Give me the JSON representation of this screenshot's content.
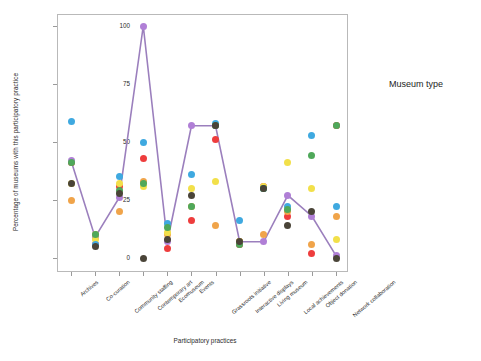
{
  "chart_data": {
    "type": "scatter",
    "title": "",
    "xlabel": "Participatory practices",
    "ylabel": "Percentage of museums with this participatory practice",
    "ylim": [
      0,
      100
    ],
    "yticks": [
      0,
      25,
      50,
      75,
      100
    ],
    "grid": false,
    "legend_position": "right",
    "legend_title": "Museum type",
    "categories": [
      "Archives",
      "Co-curation",
      "Community staffing",
      "Contemporary art",
      "Ecomuseum",
      "Events",
      "Grassroots initiative",
      "Interactive displays",
      "Living museum",
      "Local achievements",
      "Object donation",
      "Network collaboration"
    ],
    "series": [
      {
        "name": "Archaeology",
        "color": "#ee3d3d",
        "values": [
          41,
          6,
          31,
          43,
          4,
          16,
          51,
          6,
          31,
          18,
          2,
          57
        ]
      },
      {
        "name": "Art",
        "color": "#b07fd6",
        "values": [
          42,
          9,
          26,
          100,
          7,
          57,
          57,
          7,
          7,
          27,
          18,
          1
        ]
      },
      {
        "name": "Built heritage",
        "color": "#f0a44a",
        "values": [
          25,
          10,
          20,
          33,
          10,
          22,
          14,
          7,
          10,
          20,
          6,
          18
        ]
      },
      {
        "name": "History",
        "color": "#f2e04a",
        "values": [
          32,
          8,
          32,
          31,
          11,
          30,
          33,
          7,
          31,
          41,
          30,
          8
        ]
      },
      {
        "name": "Mixed content",
        "color": "#3fa9e0",
        "values": [
          59,
          6,
          35,
          50,
          15,
          36,
          58,
          16,
          30,
          22,
          53,
          22
        ]
      },
      {
        "name": "Nature/science",
        "color": "#4fa85a",
        "values": [
          41,
          10,
          29,
          32,
          13,
          22,
          57,
          6,
          30,
          21,
          44,
          57
        ]
      },
      {
        "name": "Popular culture",
        "color": "#4a4438",
        "values": [
          32,
          5,
          28,
          0,
          8,
          27,
          57,
          7,
          30,
          14,
          20,
          0
        ]
      }
    ],
    "trend_line": {
      "name": "mean-line",
      "color": "#9b7fbd",
      "values": [
        42,
        9,
        26,
        100,
        7,
        57,
        57,
        7,
        7,
        27,
        18,
        1
      ]
    }
  }
}
